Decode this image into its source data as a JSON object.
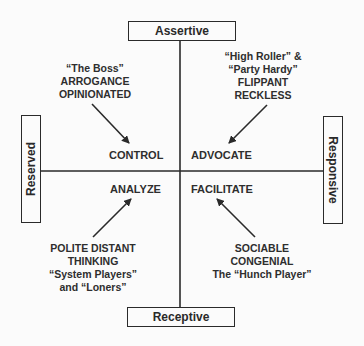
{
  "axes": {
    "top": "Assertive",
    "bottom": "Receptive",
    "left": "Reserved",
    "right": "Responsive"
  },
  "quadrants": {
    "top_left": {
      "label": "CONTROL",
      "description": [
        "“The Boss”",
        "ARROGANCE",
        "OPINIONATED"
      ]
    },
    "top_right": {
      "label": "ADVOCATE",
      "description": [
        "“High Roller” &",
        "“Party Hardy”",
        "FLIPPANT",
        "RECKLESS"
      ]
    },
    "bottom_left": {
      "label": "ANALYZE",
      "description": [
        "POLITE DISTANT",
        "THINKING",
        "“System Players”",
        "and “Loners”"
      ]
    },
    "bottom_right": {
      "label": "FACILITATE",
      "description": [
        "SOCIABLE",
        "CONGENIAL",
        "The “Hunch Player”"
      ]
    }
  },
  "colors": {
    "line": "#2a2a2a",
    "background": "#fbfbfb"
  }
}
